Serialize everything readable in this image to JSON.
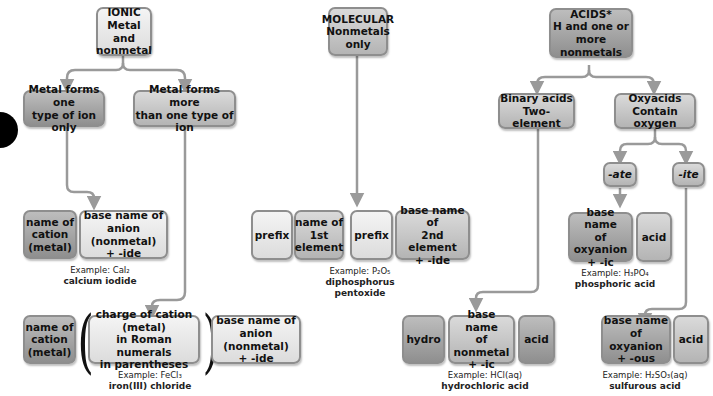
{
  "ionic": {
    "header": "IONIC\nMetal and\nnonmetal",
    "branch_one": "Metal forms one\ntype of ion only",
    "branch_more": "Metal forms more\nthan one type of ion",
    "one_row": {
      "cation": "name of\ncation\n(metal)",
      "anion": "base name of\nanion (nonmetal)\n+ -ide",
      "example_label": "Example: CaI₂",
      "example_name": "calcium iodide"
    },
    "more_row": {
      "cation": "name of\ncation\n(metal)",
      "charge": "charge of cation (metal)\nin Roman numerals\nin parentheses",
      "anion": "base name of\nanion (nonmetal)\n+ -ide",
      "paren_left": "(",
      "paren_right": ")",
      "example_label": "Example: FeCl₃",
      "example_name": "iron(III) chloride"
    }
  },
  "molecular": {
    "header": "MOLECULAR\nNonmetals\nonly",
    "row": {
      "prefix1": "prefix",
      "first": "name of\n1st\nelement",
      "prefix2": "prefix",
      "second": "base name of\n2nd element\n+ -ide",
      "example_label": "Example: P₂O₅",
      "example_name": "diphosphorus pentoxide"
    }
  },
  "acids": {
    "header": "ACIDS*\nH and one or\nmore nonmetals",
    "binary": "Binary acids\nTwo-element",
    "oxy": "Oxyacids\nContain oxygen",
    "ate": "-ate",
    "ite": "-ite",
    "ate_row": {
      "base": "base name\nof oxyanion\n+ -ic",
      "acid": "acid",
      "example_label": "Example: H₃PO₄",
      "example_name": "phosphoric acid"
    },
    "binary_row": {
      "hydro": "hydro",
      "base": "base name\nof nonmetal\n+ -ic",
      "acid": "acid",
      "example_label": "Example: HCl(aq)",
      "example_name": "hydrochloric acid"
    },
    "ite_row": {
      "base": "base name\nof oxyanion\n+ -ous",
      "acid": "acid",
      "example_label": "Example: H₂SO₃(aq)",
      "example_name": "sulfurous acid"
    }
  },
  "colors": {
    "connector": "#9a9a9a",
    "box_border": "#8e8e8e"
  }
}
